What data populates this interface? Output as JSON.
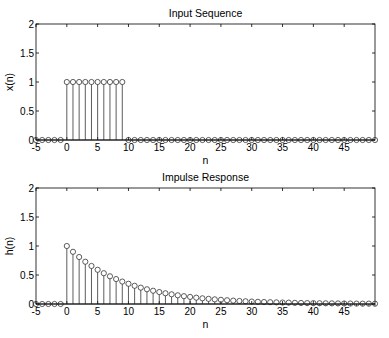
{
  "chart_data": [
    {
      "type": "stem",
      "title": "Input Sequence",
      "xlabel": "n",
      "ylabel": "x(n)",
      "xlim": [
        -5,
        50
      ],
      "ylim": [
        0,
        2
      ],
      "xticks": [
        -5,
        0,
        5,
        10,
        15,
        20,
        25,
        30,
        35,
        40,
        45
      ],
      "yticks": [
        0,
        0.5,
        1,
        1.5,
        2
      ],
      "ytick_labels": [
        "0",
        "0.5",
        "1",
        "1.5",
        "2"
      ],
      "grid": false,
      "x": [
        -5,
        -4,
        -3,
        -2,
        -1,
        0,
        1,
        2,
        3,
        4,
        5,
        6,
        7,
        8,
        9,
        10,
        11,
        12,
        13,
        14,
        15,
        16,
        17,
        18,
        19,
        20,
        21,
        22,
        23,
        24,
        25,
        26,
        27,
        28,
        29,
        30,
        31,
        32,
        33,
        34,
        35,
        36,
        37,
        38,
        39,
        40,
        41,
        42,
        43,
        44,
        45,
        46,
        47,
        48,
        49,
        50
      ],
      "values": [
        0,
        0,
        0,
        0,
        0,
        1,
        1,
        1,
        1,
        1,
        1,
        1,
        1,
        1,
        1,
        0,
        0,
        0,
        0,
        0,
        0,
        0,
        0,
        0,
        0,
        0,
        0,
        0,
        0,
        0,
        0,
        0,
        0,
        0,
        0,
        0,
        0,
        0,
        0,
        0,
        0,
        0,
        0,
        0,
        0,
        0,
        0,
        0,
        0,
        0,
        0,
        0,
        0,
        0,
        0,
        0
      ]
    },
    {
      "type": "stem",
      "title": "Impulse Response",
      "xlabel": "n",
      "ylabel": "h(n)",
      "xlim": [
        -5,
        50
      ],
      "ylim": [
        0,
        2
      ],
      "xticks": [
        -5,
        0,
        5,
        10,
        15,
        20,
        25,
        30,
        35,
        40,
        45
      ],
      "yticks": [
        0,
        0.5,
        1,
        1.5,
        2
      ],
      "ytick_labels": [
        "0",
        "0.5",
        "1",
        "1.5",
        "2"
      ],
      "grid": false,
      "formula": "h(n) = 0.9^n u(n)",
      "x": [
        -5,
        -4,
        -3,
        -2,
        -1,
        0,
        1,
        2,
        3,
        4,
        5,
        6,
        7,
        8,
        9,
        10,
        11,
        12,
        13,
        14,
        15,
        16,
        17,
        18,
        19,
        20,
        21,
        22,
        23,
        24,
        25,
        26,
        27,
        28,
        29,
        30,
        31,
        32,
        33,
        34,
        35,
        36,
        37,
        38,
        39,
        40,
        41,
        42,
        43,
        44,
        45,
        46,
        47,
        48,
        49,
        50
      ],
      "values": [
        0,
        0,
        0,
        0,
        0,
        1,
        0.9,
        0.81,
        0.729,
        0.656,
        0.59,
        0.531,
        0.478,
        0.43,
        0.387,
        0.349,
        0.314,
        0.282,
        0.254,
        0.229,
        0.206,
        0.185,
        0.167,
        0.15,
        0.135,
        0.122,
        0.109,
        0.098,
        0.089,
        0.08,
        0.072,
        0.065,
        0.058,
        0.052,
        0.047,
        0.042,
        0.038,
        0.034,
        0.031,
        0.028,
        0.025,
        0.023,
        0.02,
        0.018,
        0.016,
        0.015,
        0.013,
        0.012,
        0.011,
        0.01,
        0.009,
        0.008,
        0.007,
        0.006,
        0.006,
        0.005
      ]
    }
  ]
}
